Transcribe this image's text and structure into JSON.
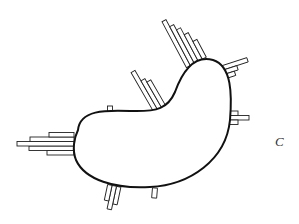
{
  "figure": {
    "panel_label": "C",
    "colors": {
      "outline": "#111111",
      "bars_stroke": "#222222",
      "background": "#ffffff"
    },
    "bar_clusters": [
      {
        "position": "top",
        "count": 5
      },
      {
        "position": "upper-middle",
        "count": 3
      },
      {
        "position": "upper-right",
        "count": 3
      },
      {
        "position": "right",
        "count": 3
      },
      {
        "position": "right-lower",
        "count": 1
      },
      {
        "position": "left",
        "count": 5
      },
      {
        "position": "bottom-left",
        "count": 3
      },
      {
        "position": "bottom",
        "count": 1
      },
      {
        "position": "top-left-edge",
        "count": 1
      }
    ]
  }
}
